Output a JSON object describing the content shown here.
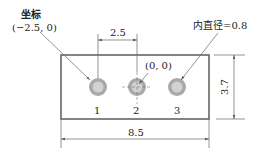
{
  "diagram": {
    "type": "technical-drawing",
    "annotations": {
      "coordinate_label": "坐标",
      "coordinate_value": "(−2.5, 0)",
      "origin_value": "(0, 0)",
      "inner_diameter_label": "内直径=0.8"
    },
    "dimensions": {
      "hole_spacing": "2.5",
      "width": "8.5",
      "height": "3.7"
    },
    "holes": [
      {
        "id": "1",
        "label": "1"
      },
      {
        "id": "2",
        "label": "2"
      },
      {
        "id": "3",
        "label": "3"
      }
    ],
    "colors": {
      "outline": "#555555",
      "hole_ring": "#a8a8a8",
      "hole_fill": "#d0d0d0",
      "dim_line": "#666666"
    }
  }
}
